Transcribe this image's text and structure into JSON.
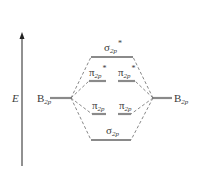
{
  "diagram": {
    "type": "molecular-orbital-energy-diagram",
    "axis": {
      "label": "E",
      "direction": "up"
    },
    "atomic_orbitals": {
      "left": {
        "base": "B",
        "sub": "2p"
      },
      "right": {
        "base": "B",
        "sub": "2p"
      }
    },
    "molecular_orbitals": {
      "sigma_star": {
        "base": "σ",
        "sub": "2p",
        "sup": "*"
      },
      "pi_star_left": {
        "base": "π",
        "sub": "2p",
        "sup": "*"
      },
      "pi_star_right": {
        "base": "π",
        "sub": "2p",
        "sup": "*"
      },
      "pi_left": {
        "base": "π",
        "sub": "2p"
      },
      "pi_right": {
        "base": "π",
        "sub": "2p"
      },
      "sigma": {
        "base": "σ",
        "sub": "2p"
      }
    },
    "colors": {
      "level_line": "#8a8a8a",
      "dashed_line": "#6a6a6a",
      "axis": "#222222",
      "text": "#3a3a3a"
    }
  }
}
